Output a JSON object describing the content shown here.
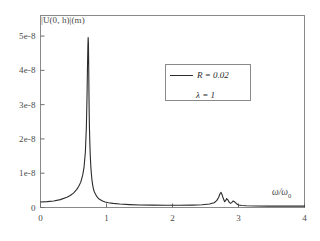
{
  "chart_data": {
    "type": "line",
    "title": "",
    "xlabel": "ω/ω₀",
    "ylabel": "|U(0, h)|(m)",
    "xlim": [
      0,
      4
    ],
    "ylim": [
      0,
      5.6e-08
    ],
    "grid": false,
    "legend_position": "upper-center-right",
    "xticks": [
      "0",
      "1",
      "2",
      "3",
      "4"
    ],
    "xtick_values": [
      0,
      1,
      2,
      3,
      4
    ],
    "yticks": [
      "0",
      "1e-8",
      "2e-8",
      "3e-8",
      "4e-8",
      "5e-8"
    ],
    "ytick_values": [
      0,
      1e-08,
      2e-08,
      3e-08,
      4e-08,
      5e-08
    ],
    "series": [
      {
        "name": "R = 0.02, λ = 1",
        "color": "#2b2b2b",
        "x": [
          0.0,
          0.1,
          0.2,
          0.3,
          0.4,
          0.45,
          0.5,
          0.55,
          0.58,
          0.61,
          0.64,
          0.66,
          0.68,
          0.695,
          0.705,
          0.712,
          0.718,
          0.722,
          0.726,
          0.73,
          0.734,
          0.738,
          0.742,
          0.748,
          0.755,
          0.762,
          0.77,
          0.78,
          0.79,
          0.8,
          0.815,
          0.83,
          0.85,
          0.875,
          0.9,
          0.94,
          0.98,
          1.03,
          1.1,
          1.2,
          1.35,
          1.5,
          1.7,
          1.9,
          2.1,
          2.3,
          2.45,
          2.56,
          2.63,
          2.67,
          2.7,
          2.72,
          2.735,
          2.75,
          2.77,
          2.79,
          2.805,
          2.82,
          2.84,
          2.86,
          2.88,
          2.9,
          2.92,
          2.945,
          2.97,
          3.0,
          3.05,
          3.12,
          3.25,
          3.45,
          3.7,
          4.0
        ],
        "y": [
          1.6e-09,
          1.7e-09,
          1.9e-09,
          2.3e-09,
          3e-09,
          3.5e-09,
          4.2e-09,
          5.3e-09,
          6.2e-09,
          7.4e-09,
          9.5e-09,
          1.18e-08,
          1.62e-08,
          2.35e-08,
          3.25e-08,
          4.1e-08,
          4.72e-08,
          4.96e-08,
          4.8e-08,
          4.2e-08,
          3.4e-08,
          2.72e-08,
          2.3e-08,
          1.85e-08,
          1.48e-08,
          1.22e-08,
          1e-08,
          8e-09,
          6.6e-09,
          5.6e-09,
          4.6e-09,
          4e-09,
          3.3e-09,
          2.7e-09,
          2.3e-09,
          1.9e-09,
          1.6e-09,
          1.4e-09,
          1.2e-09,
          1e-09,
          8.5e-10,
          7.5e-10,
          7e-10,
          6.5e-10,
          6.5e-10,
          7e-10,
          8e-10,
          1e-09,
          1.4e-09,
          2e-09,
          3e-09,
          4e-09,
          4.4e-09,
          3.8e-09,
          2.6e-09,
          1.7e-09,
          2e-09,
          2.6e-09,
          2.2e-09,
          1.5e-09,
          1.2e-09,
          1.5e-09,
          1.9e-09,
          1.6e-09,
          1.1e-09,
          7.5e-10,
          6e-10,
          5e-10,
          4.5e-10,
          4e-10,
          4e-10,
          4e-10
        ]
      }
    ],
    "annotations": [
      {
        "id": "param-R",
        "text": "R = 0.02"
      },
      {
        "id": "param-lambda",
        "text": "λ = 1"
      }
    ]
  },
  "axes": {
    "y_label": "|U(0, h)|(m)",
    "x_label_symbol": "ω/ω",
    "x_label_subscript": "0",
    "y_tick_labels": [
      "5e-8",
      "4e-8",
      "3e-8",
      "2e-8",
      "1e-8",
      "0"
    ],
    "x_tick_labels": [
      "0",
      "1",
      "2",
      "3",
      "4"
    ]
  },
  "legend": {
    "line_color": "#2b2b2b",
    "entries": [
      {
        "label": "R = 0.02"
      },
      {
        "label": "λ = 1"
      }
    ]
  },
  "style": {
    "frame_color": "#8a8a8a",
    "curve_color": "#2b2b2b",
    "background": "#ffffff",
    "text_color": "#4a4a4a"
  }
}
